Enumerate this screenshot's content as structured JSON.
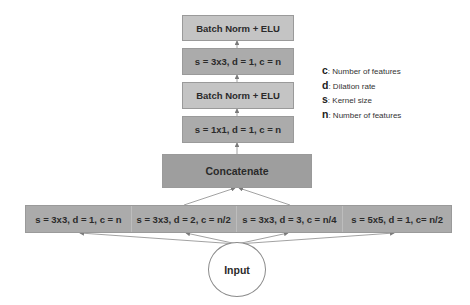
{
  "diagram": {
    "stack": [
      {
        "id": "bn-elu-top",
        "label": "Batch Norm + ELU"
      },
      {
        "id": "conv-3x3",
        "label": "s = 3x3, d = 1, c = n"
      },
      {
        "id": "bn-elu-mid",
        "label": "Batch Norm + ELU"
      },
      {
        "id": "conv-1x1",
        "label": "s = 1x1, d = 1, c = n"
      }
    ],
    "concatenate": {
      "label": "Concatenate"
    },
    "branches": [
      {
        "label": "s = 3x3, d = 1, c = n"
      },
      {
        "label": "s = 3x3, d = 2, c = n/2"
      },
      {
        "label": "s = 3x3, d = 3, c = n/4"
      },
      {
        "label": "s = 5x5, d = 1, c= n/2"
      }
    ],
    "input": {
      "label": "Input"
    },
    "legend": [
      {
        "key": "c",
        "text": ": Number of features"
      },
      {
        "key": "d",
        "text": ": Dilation rate"
      },
      {
        "key": "s",
        "text": ": Kernel size"
      },
      {
        "key": "n",
        "text": ": Number of features"
      }
    ],
    "colors": {
      "box_light": "#c4c4c4",
      "box_mid": "#ababab",
      "concat": "#9e9e9e",
      "arrow": "#7a7a7a"
    }
  }
}
